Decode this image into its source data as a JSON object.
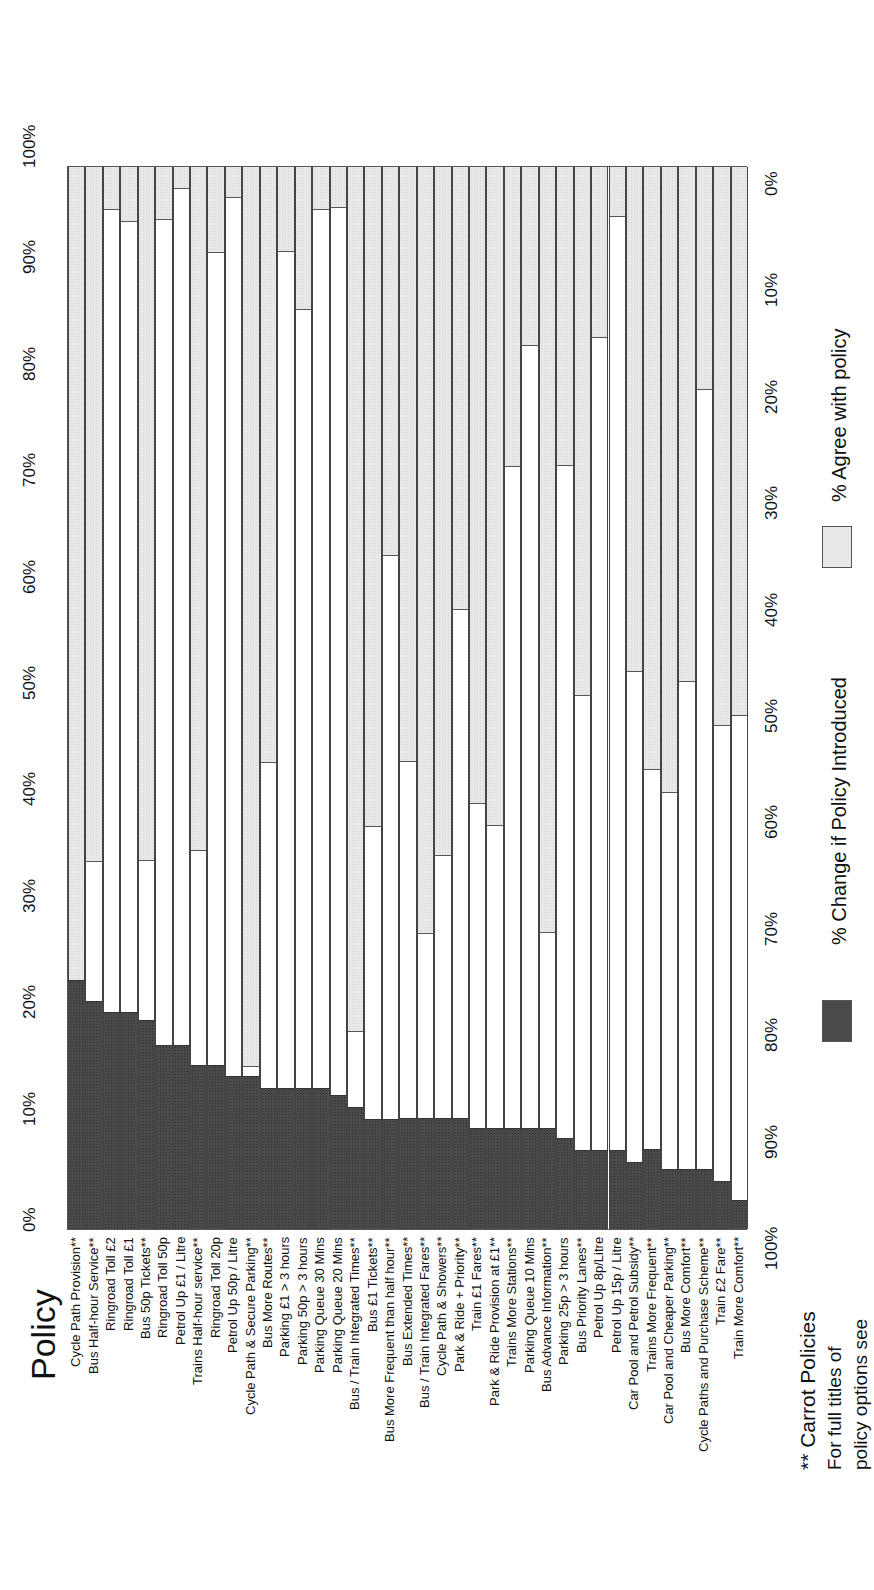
{
  "title": "Policy",
  "left_axis": {
    "ticks": [
      "0%",
      "10%",
      "20%",
      "30%",
      "40%",
      "50%",
      "60%",
      "70%",
      "80%",
      "90%",
      "100%"
    ]
  },
  "right_axis": {
    "ticks": [
      "0%",
      "10%",
      "20%",
      "30%",
      "40%",
      "50%",
      "60%",
      "70%",
      "80%",
      "90%",
      "100%"
    ]
  },
  "legend": {
    "change_label": "% Change if Policy Introduced",
    "agree_label": "% Agree with policy"
  },
  "footnote": {
    "heading": "** Carrot Policies",
    "line1": "For full titles of",
    "line2": "policy options see"
  },
  "colors": {
    "change": "#4a4a4a",
    "agree": "#e8e8e8",
    "gap": "#ffffff",
    "border": "#555555"
  },
  "chart_data": {
    "type": "bar",
    "orientation": "stacked-100, rotated 90deg (category labels along bottom, read rotated)",
    "title": "Policy",
    "xlabel": "Policy",
    "ylabel_left": "% Change if Policy Introduced (0% bottom to 100% top)",
    "ylabel_right": "% Agree with policy (0% top to 100% bottom)",
    "ylim": [
      0,
      100
    ],
    "grid": false,
    "legend_position": "right",
    "categories": [
      "Cycle Path Provision**",
      "Bus Half-hour Service**",
      "Ringroad Toll £2",
      "Ringroad Toll £1",
      "Bus 50p Tickets**",
      "Ringroad Toll 50p",
      "Petrol Up  £1 / Litre",
      "Trains Half-hour service**",
      "Ringroad Toll 20p",
      "Petrol Up 50p / Litre",
      "Cycle Path & Secure Parking**",
      "Bus More Routes**",
      "Parking £1 > 3 hours",
      "Parking 50p > 3 hours",
      "Parking Queue 30 Mins",
      "Parking Queue 20 Mins",
      "Bus / Train Integrated Times**",
      "Bus £1 Tickets**",
      "Bus More Frequent than half hour**",
      "Bus Extended Times**",
      "Bus / Train Integrated Fares**",
      "Cycle Path & Showers**",
      "Park & Ride + Priority**",
      "Train £1 Fares**",
      "Park & Ride Provision at £1**",
      "Trains More Stations**",
      "Parking Queue 10 Mins",
      "Bus Advance Information**",
      "Parking 25p > 3 hours",
      "Bus Priority Lanes**",
      "Petrol Up 8p/Litre",
      "Petrol Up 15p / Litre",
      "Car Pool and Petrol Subsidy**",
      "Trains More Frequent**",
      "Car Pool and Cheaper Parking**",
      "Bus More Comfort**",
      "Cycle Paths and Purchase Scheme**",
      "Train £2 Fare**",
      "Train More Comfort**"
    ],
    "series": [
      {
        "name": "% Change if Policy Introduced",
        "color": "#4a4a4a",
        "values": [
          23.4,
          21.4,
          20.4,
          20.4,
          19.6,
          17.3,
          17.3,
          15.4,
          15.4,
          14.4,
          14.4,
          13.3,
          13.3,
          13.3,
          13.3,
          12.6,
          11.5,
          10.3,
          10.3,
          10.4,
          10.4,
          10.4,
          10.4,
          9.5,
          9.5,
          9.5,
          9.5,
          9.5,
          8.6,
          7.4,
          7.4,
          7.4,
          6.3,
          7.5,
          5.6,
          5.6,
          5.6,
          4.5,
          2.7
        ]
      },
      {
        "name": "% Agree with policy",
        "color": "#e8e8e8",
        "values": [
          76.6,
          65.3,
          4.0,
          5.2,
          65.2,
          5.0,
          2.1,
          64.3,
          8.1,
          2.9,
          84.6,
          56.0,
          8.0,
          13.4,
          4.0,
          3.9,
          81.3,
          62.0,
          36.6,
          55.9,
          72.1,
          64.8,
          41.6,
          59.9,
          61.9,
          28.2,
          16.8,
          72.0,
          28.1,
          49.7,
          16.1,
          4.7,
          47.5,
          56.7,
          58.8,
          48.4,
          21.0,
          52.5,
          51.6
        ]
      }
    ]
  }
}
